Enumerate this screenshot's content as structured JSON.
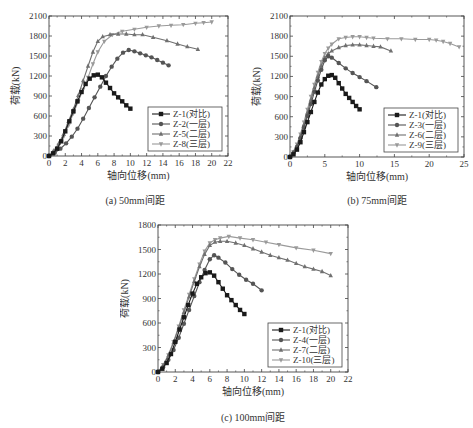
{
  "chart_data": [
    {
      "id": "a",
      "type": "line",
      "caption": "(a) 50mm间距",
      "xlabel": "轴向位移(mm)",
      "ylabel": "荷载(kN)",
      "xlim": [
        0,
        22
      ],
      "ylim": [
        0,
        2100
      ],
      "xticks": [
        0,
        2,
        4,
        6,
        8,
        10,
        12,
        14,
        16,
        18,
        20,
        22
      ],
      "yticks": [
        0,
        300,
        600,
        900,
        1200,
        1500,
        1800,
        2100
      ],
      "grid": false,
      "legend_position": "lower right",
      "series": [
        {
          "name": "Z-1(对比)",
          "marker": "square",
          "color": "#1a1a1a",
          "x": [
            0,
            0.5,
            1,
            1.5,
            2,
            2.5,
            3,
            3.5,
            4,
            4.5,
            5,
            5.5,
            6,
            6.5,
            7,
            7.5,
            8,
            8.5,
            9,
            9.5,
            10
          ],
          "y": [
            0,
            40,
            110,
            220,
            370,
            520,
            670,
            820,
            960,
            1080,
            1160,
            1210,
            1220,
            1180,
            1100,
            1020,
            940,
            880,
            820,
            760,
            710
          ]
        },
        {
          "name": "Z-2(一层)",
          "marker": "circle",
          "color": "#555555",
          "x": [
            0,
            0.7,
            1.4,
            2.1,
            2.8,
            3.5,
            4.2,
            4.9,
            5.6,
            6.3,
            7,
            7.7,
            8.4,
            9.1,
            9.8,
            10.5,
            11.2,
            11.9,
            12.6,
            13.3,
            14,
            14.7
          ],
          "y": [
            0,
            50,
            110,
            190,
            290,
            410,
            560,
            720,
            880,
            1040,
            1200,
            1340,
            1460,
            1550,
            1590,
            1570,
            1540,
            1510,
            1480,
            1440,
            1400,
            1360
          ]
        },
        {
          "name": "Z-5(二层)",
          "marker": "triangle-up",
          "color": "#707070",
          "x": [
            0,
            0.6,
            1.2,
            1.8,
            2.4,
            3,
            3.6,
            4.2,
            4.8,
            5.4,
            6,
            6.6,
            7.5,
            8.5,
            9.5,
            10.5,
            11.5,
            12.8,
            14.5,
            15.8,
            17,
            18.3
          ],
          "y": [
            0,
            80,
            190,
            330,
            520,
            700,
            910,
            1130,
            1350,
            1560,
            1720,
            1790,
            1820,
            1830,
            1830,
            1820,
            1820,
            1780,
            1730,
            1680,
            1640,
            1600
          ]
        },
        {
          "name": "Z-8(三层)",
          "marker": "triangle-down",
          "color": "#9a9a9a",
          "x": [
            0,
            0.6,
            1.2,
            1.8,
            2.4,
            3,
            3.6,
            4.2,
            4.8,
            5.4,
            6,
            6.8,
            7.8,
            9,
            10.5,
            12,
            13.5,
            15,
            16.5,
            18,
            19,
            20
          ],
          "y": [
            0,
            70,
            160,
            290,
            460,
            640,
            820,
            1000,
            1180,
            1380,
            1560,
            1720,
            1820,
            1870,
            1900,
            1930,
            1950,
            1960,
            1970,
            1990,
            2000,
            2010
          ]
        }
      ]
    },
    {
      "id": "b",
      "type": "line",
      "caption": "(b) 75mm间距",
      "xlabel": "轴向位移(mm)",
      "ylabel": "荷载(kN)",
      "xlim": [
        0,
        25
      ],
      "ylim": [
        0,
        2100
      ],
      "xticks": [
        0,
        5,
        10,
        15,
        20,
        25
      ],
      "yticks": [
        0,
        300,
        600,
        900,
        1200,
        1500,
        1800,
        2100
      ],
      "grid": false,
      "legend_position": "lower right",
      "series": [
        {
          "name": "Z-1(对比)",
          "marker": "square",
          "color": "#1a1a1a",
          "x": [
            0,
            0.5,
            1,
            1.5,
            2,
            2.5,
            3,
            3.5,
            4,
            4.5,
            5,
            5.5,
            6,
            6.5,
            7,
            7.5,
            8,
            8.5,
            9,
            9.5,
            10
          ],
          "y": [
            0,
            40,
            110,
            220,
            370,
            520,
            670,
            820,
            960,
            1080,
            1160,
            1210,
            1220,
            1180,
            1100,
            1020,
            940,
            880,
            820,
            760,
            710
          ]
        },
        {
          "name": "Z-3(一层)",
          "marker": "circle",
          "color": "#555555",
          "x": [
            0,
            0.5,
            1,
            1.5,
            2,
            2.5,
            3,
            3.5,
            4,
            4.5,
            5,
            5.5,
            6,
            7,
            8,
            9,
            10,
            11,
            12.4
          ],
          "y": [
            0,
            60,
            150,
            280,
            440,
            610,
            790,
            970,
            1140,
            1300,
            1440,
            1500,
            1480,
            1400,
            1320,
            1250,
            1190,
            1130,
            1040
          ]
        },
        {
          "name": "Z-6(二层)",
          "marker": "triangle-up",
          "color": "#707070",
          "x": [
            0,
            0.5,
            1,
            1.5,
            2,
            2.5,
            3,
            3.5,
            4,
            4.5,
            5,
            5.5,
            6,
            7,
            8,
            9,
            10,
            11,
            12,
            13,
            14.5
          ],
          "y": [
            0,
            70,
            170,
            310,
            480,
            660,
            850,
            1030,
            1200,
            1360,
            1480,
            1540,
            1580,
            1630,
            1660,
            1670,
            1670,
            1660,
            1650,
            1640,
            1580
          ]
        },
        {
          "name": "Z-9(三层)",
          "marker": "triangle-down",
          "color": "#9a9a9a",
          "x": [
            0,
            0.5,
            1,
            1.5,
            2,
            2.5,
            3,
            3.5,
            4,
            4.5,
            5,
            5.5,
            6,
            7,
            8,
            9,
            10,
            11,
            12,
            14,
            16,
            18,
            20,
            21,
            22,
            23,
            24.3
          ],
          "y": [
            0,
            80,
            190,
            340,
            520,
            710,
            900,
            1080,
            1260,
            1420,
            1540,
            1620,
            1680,
            1760,
            1780,
            1790,
            1790,
            1780,
            1770,
            1760,
            1760,
            1750,
            1750,
            1740,
            1720,
            1690,
            1640
          ]
        }
      ]
    },
    {
      "id": "c",
      "type": "line",
      "caption": "(c) 100mm间距",
      "xlabel": "轴向位移(mm)",
      "ylabel": "荷载(kN)",
      "xlim": [
        0,
        22
      ],
      "ylim": [
        0,
        1800
      ],
      "xticks": [
        0,
        2,
        4,
        6,
        8,
        10,
        12,
        14,
        16,
        18,
        20,
        22
      ],
      "yticks": [
        0,
        300,
        600,
        900,
        1200,
        1500,
        1800
      ],
      "grid": false,
      "legend_position": "lower right",
      "series": [
        {
          "name": "Z-1(对比)",
          "marker": "square",
          "color": "#1a1a1a",
          "x": [
            0,
            0.5,
            1,
            1.5,
            2,
            2.5,
            3,
            3.5,
            4,
            4.5,
            5,
            5.5,
            6,
            6.5,
            7,
            7.5,
            8,
            8.5,
            9,
            9.5,
            10
          ],
          "y": [
            0,
            40,
            110,
            220,
            370,
            520,
            670,
            820,
            960,
            1080,
            1160,
            1210,
            1220,
            1180,
            1100,
            1020,
            940,
            880,
            820,
            760,
            710
          ]
        },
        {
          "name": "Z-4(一层)",
          "marker": "circle",
          "color": "#555555",
          "x": [
            0,
            0.6,
            1.2,
            1.8,
            2.4,
            3,
            3.6,
            4.2,
            4.8,
            5.4,
            6,
            6.5,
            7,
            7.8,
            8.6,
            9.4,
            10.2,
            11,
            12
          ],
          "y": [
            0,
            60,
            150,
            270,
            420,
            590,
            760,
            930,
            1100,
            1250,
            1380,
            1430,
            1400,
            1340,
            1260,
            1190,
            1130,
            1080,
            1000
          ]
        },
        {
          "name": "Z-7(二层)",
          "marker": "triangle-up",
          "color": "#707070",
          "x": [
            0,
            0.6,
            1.2,
            1.8,
            2.4,
            3,
            3.6,
            4.2,
            4.8,
            5.4,
            6,
            6.6,
            7.2,
            8,
            9,
            10,
            11,
            12,
            13,
            14,
            15,
            16,
            17,
            18,
            19,
            20
          ],
          "y": [
            0,
            80,
            200,
            360,
            540,
            730,
            920,
            1110,
            1290,
            1440,
            1550,
            1590,
            1600,
            1600,
            1580,
            1550,
            1510,
            1470,
            1430,
            1400,
            1370,
            1330,
            1290,
            1260,
            1230,
            1180
          ]
        },
        {
          "name": "Z-10(三层)",
          "marker": "triangle-down",
          "color": "#9a9a9a",
          "x": [
            0,
            0.6,
            1.2,
            1.8,
            2.4,
            3,
            3.6,
            4.2,
            4.8,
            5.4,
            6,
            6.6,
            7.2,
            8.2,
            9.5,
            11,
            12.5,
            14,
            16,
            18,
            20
          ],
          "y": [
            0,
            90,
            210,
            370,
            560,
            760,
            950,
            1140,
            1320,
            1480,
            1580,
            1620,
            1640,
            1660,
            1640,
            1620,
            1590,
            1560,
            1520,
            1490,
            1450
          ]
        }
      ]
    }
  ]
}
